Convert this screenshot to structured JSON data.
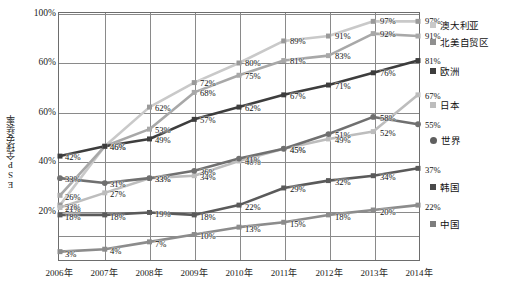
{
  "chart_data": {
    "type": "line",
    "title": "",
    "xlabel": "",
    "ylabel": "ESP全球安装率",
    "ylim": [
      0,
      100
    ],
    "grid": true,
    "legend_position": "right",
    "categories": [
      "2006年",
      "2007年",
      "2008年",
      "2009年",
      "2010年",
      "2011年",
      "2012年",
      "2013年",
      "2014年"
    ],
    "ytick_labels": [
      "100%",
      "60%",
      "60%",
      "40%",
      "20%"
    ],
    "ytick_values": [
      100,
      80,
      60,
      40,
      20
    ],
    "series": [
      {
        "name": "澳大利亚",
        "marker": "square",
        "color": "#c9c9c9",
        "values": [
          22,
          46,
          62,
          72,
          80,
          89,
          91,
          97,
          97
        ],
        "labels": [
          "22%",
          "46%",
          "62%",
          "72%",
          "80%",
          "89%",
          "91%",
          "97%",
          "97%"
        ]
      },
      {
        "name": "北美自贸区",
        "marker": "square",
        "color": "#a8a8a8",
        "values": [
          26,
          46,
          53,
          68,
          75,
          81,
          83,
          92,
          91
        ],
        "labels": [
          "26%",
          "46%",
          "53%",
          "68%",
          "75%",
          "81%",
          "83%",
          "92%",
          "91%"
        ]
      },
      {
        "name": "欧洲",
        "marker": "square",
        "color": "#3d3d3d",
        "values": [
          42,
          46,
          49,
          57,
          62,
          67,
          71,
          76,
          81
        ],
        "labels": [
          "42%",
          "46%",
          "49%",
          "57%",
          "62%",
          "67%",
          "71%",
          "76%",
          "81%"
        ]
      },
      {
        "name": "日本",
        "marker": "square",
        "color": "#bdbdbd",
        "values": [
          21,
          27,
          33,
          34,
          40,
          45,
          49,
          52,
          67
        ],
        "labels": [
          "21%",
          "27%",
          "33%",
          "34%",
          "40%",
          "45%",
          "49%",
          "52%",
          "67%"
        ]
      },
      {
        "name": "世界",
        "marker": "circle",
        "color": "#707070",
        "values": [
          33,
          31,
          33,
          36,
          41,
          45,
          51,
          58,
          55
        ],
        "labels": [
          "33%",
          "31%",
          "33%",
          "36%",
          "41%",
          "45%",
          "51%",
          "58%",
          "55%"
        ]
      },
      {
        "name": "韩国",
        "marker": "square",
        "color": "#5a5a5a",
        "values": [
          18,
          18,
          19,
          18,
          22,
          29,
          32,
          34,
          37
        ],
        "labels": [
          "18%",
          "18%",
          "19%",
          "18%",
          "22%",
          "29%",
          "32%",
          "34%",
          "37%"
        ]
      },
      {
        "name": "中国",
        "marker": "square",
        "color": "#8c8c8c",
        "values": [
          3,
          4,
          7,
          10,
          13,
          15,
          18,
          20,
          22
        ],
        "labels": [
          "3%",
          "4%",
          "7%",
          "10%",
          "13%",
          "15%",
          "18%",
          "20%",
          "22%"
        ]
      }
    ],
    "legend_entries": [
      {
        "value": "97%",
        "label": "澳大利亚",
        "marker": "square",
        "color": "#c9c9c9"
      },
      {
        "value": "91%",
        "label": "北美自贸区",
        "marker": "square",
        "color": "#8f8f8f"
      },
      {
        "value": "81%",
        "label": "欧洲",
        "marker": "square",
        "color": "#3d3d3d"
      },
      {
        "value": "67%",
        "label": "日本",
        "marker": "square",
        "color": "#bdbdbd"
      },
      {
        "value": "55%",
        "label": "世界",
        "marker": "circle",
        "color": "#5f5f5f"
      },
      {
        "value": "37%",
        "label": "韩国",
        "marker": "square",
        "color": "#4a4a4a"
      },
      {
        "value": "22%",
        "label": "中国",
        "marker": "square",
        "color": "#7d7d7d"
      }
    ]
  }
}
